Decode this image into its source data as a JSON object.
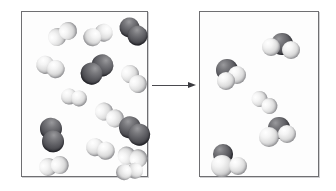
{
  "figure": {
    "width": 336,
    "height": 191,
    "background_color": "#ffffff"
  },
  "colors": {
    "light_atom": "#e8e8e8",
    "dark_atom": "#4a4a50",
    "panel_border": "#6f6f72",
    "panel_fill": "#fdfdfd",
    "arrow": "#3a3a3f"
  },
  "arrow": {
    "name": "reaction-arrow",
    "direction": "right",
    "x": 152,
    "y": 82,
    "length": 44
  },
  "panels": [
    {
      "id": "reactants",
      "label": "",
      "x": 21,
      "y": 11,
      "width": 127,
      "height": 166,
      "molecules": [
        {
          "name": "light-diatomic",
          "x": 26,
          "y": 10,
          "rotation": -58,
          "atoms": [
            {
              "type": "light",
              "cx": 0,
              "cy": 0,
              "r": 9
            },
            {
              "type": "light",
              "cx": 11,
              "cy": 6,
              "r": 9
            }
          ]
        },
        {
          "name": "light-diatomic",
          "x": 66,
          "y": 8,
          "rotation": 78,
          "atoms": [
            {
              "type": "light",
              "cx": 0,
              "cy": 0,
              "r": 9
            },
            {
              "type": "light",
              "cx": 2,
              "cy": 12,
              "r": 9
            }
          ]
        },
        {
          "name": "dark-diatomic",
          "x": 96,
          "y": 8,
          "rotation": 30,
          "atoms": [
            {
              "type": "dark",
              "cx": 0,
              "cy": 0,
              "r": 10
            },
            {
              "type": "dark",
              "cx": 11,
              "cy": 3,
              "r": 10
            }
          ]
        },
        {
          "name": "light-diatomic",
          "x": 14,
          "y": 45,
          "rotation": 12,
          "atoms": [
            {
              "type": "light",
              "cx": 0,
              "cy": 0,
              "r": 9
            },
            {
              "type": "light",
              "cx": 11,
              "cy": 2,
              "r": 9
            }
          ]
        },
        {
          "name": "dark-diatomic",
          "x": 62,
          "y": 40,
          "rotation": 70,
          "atoms": [
            {
              "type": "dark",
              "cx": 0,
              "cy": 0,
              "r": 11
            },
            {
              "type": "dark",
              "cx": 4,
              "cy": 13,
              "r": 11
            }
          ]
        },
        {
          "name": "light-diatomic",
          "x": 101,
          "y": 52,
          "rotation": -20,
          "atoms": [
            {
              "type": "light",
              "cx": 0,
              "cy": 0,
              "r": 9
            },
            {
              "type": "light",
              "cx": 4,
              "cy": 12,
              "r": 9
            }
          ]
        },
        {
          "name": "light-diatomic",
          "x": 39,
          "y": 77,
          "rotation": 5,
          "atoms": [
            {
              "type": "light",
              "cx": 0,
              "cy": 0,
              "r": 8
            },
            {
              "type": "light",
              "cx": 10,
              "cy": 1,
              "r": 8
            }
          ]
        },
        {
          "name": "light-diatomic",
          "x": 76,
          "y": 88,
          "rotation": -35,
          "atoms": [
            {
              "type": "light",
              "cx": 0,
              "cy": 0,
              "r": 9
            },
            {
              "type": "light",
              "cx": 5,
              "cy": 12,
              "r": 9
            }
          ]
        },
        {
          "name": "dark-diatomic",
          "x": 14,
          "y": 108,
          "rotation": 42,
          "atoms": [
            {
              "type": "dark",
              "cx": 0,
              "cy": 0,
              "r": 11
            },
            {
              "type": "dark",
              "cx": 10,
              "cy": 8,
              "r": 11
            }
          ]
        },
        {
          "name": "dark-diatomic",
          "x": 96,
          "y": 106,
          "rotation": 18,
          "atoms": [
            {
              "type": "dark",
              "cx": 0,
              "cy": 0,
              "r": 11
            },
            {
              "type": "dark",
              "cx": 11,
              "cy": 4,
              "r": 11
            }
          ]
        },
        {
          "name": "light-diatomic",
          "x": 64,
          "y": 127,
          "rotation": 8,
          "atoms": [
            {
              "type": "light",
              "cx": 0,
              "cy": 0,
              "r": 9
            },
            {
              "type": "light",
              "cx": 11,
              "cy": 2,
              "r": 9
            }
          ]
        },
        {
          "name": "light-diatomic",
          "x": 101,
          "y": 130,
          "rotation": -72,
          "atoms": [
            {
              "type": "light",
              "cx": 0,
              "cy": 0,
              "r": 9
            },
            {
              "type": "light",
              "cx": 1,
              "cy": 12,
              "r": 9
            }
          ]
        },
        {
          "name": "light-diatomic",
          "x": 18,
          "y": 142,
          "rotation": -40,
          "atoms": [
            {
              "type": "light",
              "cx": 0,
              "cy": 0,
              "r": 9
            },
            {
              "type": "light",
              "cx": 10,
              "cy": 6,
              "r": 9
            }
          ]
        },
        {
          "name": "light-diatomic",
          "x": 99,
          "y": 146,
          "rotation": 88,
          "atoms": [
            {
              "type": "light",
              "cx": 0,
              "cy": 0,
              "r": 8
            },
            {
              "type": "light",
              "cx": 1,
              "cy": 11,
              "r": 8
            }
          ]
        }
      ]
    },
    {
      "id": "products",
      "label": "",
      "x": 199,
      "y": 11,
      "width": 120,
      "height": 166,
      "molecules": [
        {
          "name": "triatomic-molecule",
          "x": 62,
          "y": 17,
          "rotation": 0,
          "atoms": [
            {
              "type": "dark",
              "cx": 9,
              "cy": 4,
              "r": 11
            },
            {
              "type": "light",
              "cx": 0,
              "cy": 9,
              "r": 9
            },
            {
              "type": "light",
              "cx": 20,
              "cy": 12,
              "r": 9
            }
          ]
        },
        {
          "name": "triatomic-molecule",
          "x": 14,
          "y": 45,
          "rotation": 0,
          "atoms": [
            {
              "type": "dark",
              "cx": 2,
              "cy": 2,
              "r": 11
            },
            {
              "type": "light",
              "cx": 14,
              "cy": 9,
              "r": 9
            },
            {
              "type": "light",
              "cx": 3,
              "cy": 15,
              "r": 9
            }
          ]
        },
        {
          "name": "light-diatomic",
          "x": 54,
          "y": 77,
          "rotation": -30,
          "atoms": [
            {
              "type": "light",
              "cx": 0,
              "cy": 0,
              "r": 8
            },
            {
              "type": "light",
              "cx": 5,
              "cy": 11,
              "r": 8
            }
          ]
        },
        {
          "name": "triatomic-molecule",
          "x": 58,
          "y": 104,
          "rotation": 0,
          "atoms": [
            {
              "type": "dark",
              "cx": 10,
              "cy": 1,
              "r": 11
            },
            {
              "type": "light",
              "cx": 1,
              "cy": 11,
              "r": 10
            },
            {
              "type": "light",
              "cx": 20,
              "cy": 9,
              "r": 9
            }
          ]
        },
        {
          "name": "triatomic-molecule",
          "x": 10,
          "y": 132,
          "rotation": 0,
          "atoms": [
            {
              "type": "dark",
              "cx": 3,
              "cy": 0,
              "r": 10
            },
            {
              "type": "light",
              "cx": 1,
              "cy": 11,
              "r": 11
            },
            {
              "type": "light",
              "cx": 19,
              "cy": 13,
              "r": 9
            }
          ]
        }
      ]
    }
  ]
}
